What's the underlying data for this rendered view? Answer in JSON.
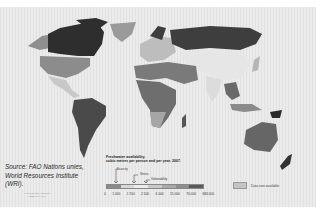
{
  "map": {
    "title": "Freshwater availability,",
    "subtitle": "cubic metres per person and per year, 2007.",
    "source_text": "Source: FAO Nations unies, World Resources Institute (WRI).",
    "small_credit": "PHILIPPE REKACEWICZ FEBRUARY 2008",
    "legend": {
      "thresholds": [
        {
          "label": "Scarcity",
          "value": 1000
        },
        {
          "label": "Stress",
          "value": 1700
        },
        {
          "label": "Vulnerability",
          "value": 2500
        }
      ],
      "scarcity_label": "Scarcity",
      "stress_label": "Stress",
      "vulnerability_label": "Vulnerability",
      "ticks": [
        "0",
        "1 000",
        "1 700",
        "2 500",
        "6 000",
        "15 000",
        "70 000",
        "684 000"
      ],
      "colors": [
        "#8a8a8a",
        "#d8d8d8",
        "#ececec",
        "#c9c9c9",
        "#a9a9a9",
        "#8c8c8c",
        "#5a5a5a"
      ],
      "no_data_label": "Data non available",
      "no_data_color": "#c4c4c4"
    },
    "regions": [
      {
        "name": "Canada",
        "shade": "#2e2e2e"
      },
      {
        "name": "Alaska",
        "shade": "#8f8f8f"
      },
      {
        "name": "United States",
        "shade": "#8c8c8c"
      },
      {
        "name": "Greenland",
        "shade": "#9a9a9a"
      },
      {
        "name": "Mexico & Central America",
        "shade": "#c8c8c8"
      },
      {
        "name": "South America",
        "shade": "#4a4a4a"
      },
      {
        "name": "Europe",
        "shade": "#bdbdbd"
      },
      {
        "name": "Russia",
        "shade": "#3e3e3e"
      },
      {
        "name": "North Africa & Middle East",
        "shade": "#7a7a7a"
      },
      {
        "name": "Sub-Saharan Africa",
        "shade": "#6e6e6e"
      },
      {
        "name": "Central Asia / China",
        "shade": "#e6e6e6"
      },
      {
        "name": "India",
        "shade": "#dcdcdc"
      },
      {
        "name": "Southeast Asia",
        "shade": "#6a6a6a"
      },
      {
        "name": "Australia",
        "shade": "#666666"
      },
      {
        "name": "New Zealand",
        "shade": "#333333"
      }
    ]
  }
}
